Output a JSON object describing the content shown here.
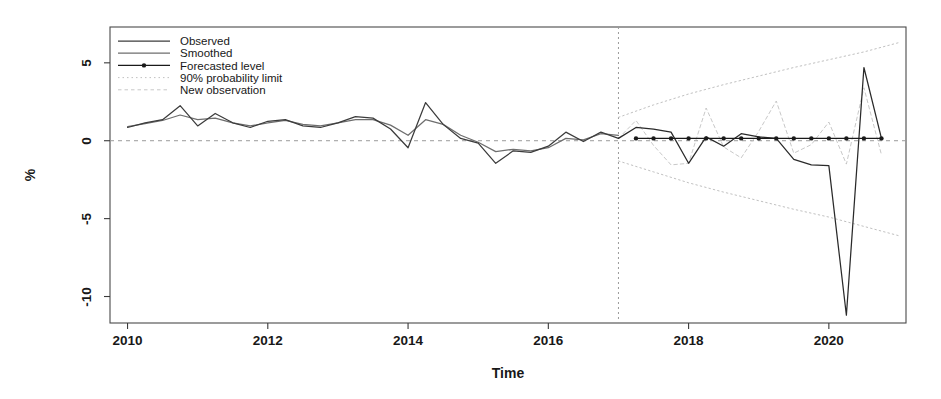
{
  "chart_data": {
    "type": "line",
    "title": "",
    "xlabel": "Time",
    "ylabel": "%",
    "xlim": [
      2009.75,
      2021.1
    ],
    "ylim": [
      -11.7,
      7.3
    ],
    "yticks": [
      5,
      0,
      -5,
      -10
    ],
    "ytick_labels": [
      "5",
      "0",
      "-5",
      "-10"
    ],
    "xticks": [
      2010,
      2012,
      2014,
      2016,
      2018,
      2020
    ],
    "xtick_labels": [
      "2010",
      "2012",
      "2014",
      "2016",
      "2018",
      "2020"
    ],
    "grid": false,
    "zero_reference_line": 0,
    "forecast_origin": 2017.0,
    "legend_position": "top-left",
    "legend": [
      {
        "label": "Observed",
        "style": "solid",
        "color": "#3c3c3c"
      },
      {
        "label": "Smoothed",
        "style": "solid",
        "color": "#6e6e6e"
      },
      {
        "label": "Forecasted level",
        "style": "solid-point",
        "color": "#1a1a1a"
      },
      {
        "label": "90% probability limit",
        "style": "dotted",
        "color": "#b9b9b9"
      },
      {
        "label": "New observation",
        "style": "dashed",
        "color": "#c2c2c2"
      }
    ],
    "series": [
      {
        "name": "Observed",
        "style": "solid",
        "color": "#3c3c3c",
        "x": [
          2010.0,
          2010.25,
          2010.5,
          2010.75,
          2011.0,
          2011.25,
          2011.5,
          2011.75,
          2012.0,
          2012.25,
          2012.5,
          2012.75,
          2013.0,
          2013.25,
          2013.5,
          2013.75,
          2014.0,
          2014.25,
          2014.5,
          2014.75,
          2015.0,
          2015.25,
          2015.5,
          2015.75,
          2016.0,
          2016.25,
          2016.5,
          2016.75,
          2017.0
        ],
        "y": [
          0.85,
          1.15,
          1.35,
          2.25,
          0.95,
          1.75,
          1.15,
          0.85,
          1.25,
          1.35,
          0.95,
          0.85,
          1.15,
          1.55,
          1.45,
          0.75,
          -0.45,
          2.45,
          1.05,
          0.15,
          -0.15,
          -1.45,
          -0.65,
          -0.75,
          -0.35,
          0.55,
          -0.05,
          0.55,
          0.15
        ]
      },
      {
        "name": "Smoothed",
        "style": "solid",
        "color": "#6e6e6e",
        "x": [
          2010.0,
          2010.25,
          2010.5,
          2010.75,
          2011.0,
          2011.25,
          2011.5,
          2011.75,
          2012.0,
          2012.25,
          2012.5,
          2012.75,
          2013.0,
          2013.25,
          2013.5,
          2013.75,
          2014.0,
          2014.25,
          2014.5,
          2014.75,
          2015.0,
          2015.25,
          2015.5,
          2015.75,
          2016.0,
          2016.25,
          2016.5,
          2016.75,
          2017.0
        ],
        "y": [
          0.9,
          1.1,
          1.3,
          1.65,
          1.35,
          1.45,
          1.15,
          0.95,
          1.15,
          1.3,
          1.05,
          0.95,
          1.15,
          1.35,
          1.35,
          1.0,
          0.35,
          1.35,
          1.05,
          0.35,
          -0.1,
          -0.7,
          -0.55,
          -0.65,
          -0.45,
          0.15,
          0.05,
          0.45,
          0.35
        ]
      },
      {
        "name": "Forecasted level",
        "style": "solid-point",
        "color": "#1a1a1a",
        "x": [
          2017.25,
          2017.5,
          2017.75,
          2018.0,
          2018.25,
          2018.5,
          2018.75,
          2019.0,
          2019.25,
          2019.5,
          2019.75,
          2020.0,
          2020.25,
          2020.5,
          2020.75
        ],
        "y": [
          0.15,
          0.15,
          0.15,
          0.15,
          0.15,
          0.15,
          0.15,
          0.15,
          0.15,
          0.15,
          0.15,
          0.15,
          0.15,
          0.15,
          0.15
        ]
      },
      {
        "name": "90% probability limit upper",
        "style": "dotted",
        "color": "#b9b9b9",
        "x": [
          2017.0,
          2017.5,
          2018.0,
          2018.5,
          2019.0,
          2019.5,
          2020.0,
          2020.5,
          2021.0
        ],
        "y": [
          1.5,
          2.3,
          3.0,
          3.6,
          4.15,
          4.7,
          5.2,
          5.7,
          6.3
        ]
      },
      {
        "name": "90% probability limit lower",
        "style": "dotted",
        "color": "#b9b9b9",
        "x": [
          2017.0,
          2017.5,
          2018.0,
          2018.5,
          2019.0,
          2019.5,
          2020.0,
          2020.5,
          2021.0
        ],
        "y": [
          -1.3,
          -2.0,
          -2.7,
          -3.3,
          -3.85,
          -4.4,
          -4.9,
          -5.5,
          -6.1
        ]
      },
      {
        "name": "New observation",
        "style": "dashed",
        "color": "#c2c2c2",
        "x": [
          2017.0,
          2017.25,
          2017.5,
          2017.75,
          2018.0,
          2018.25,
          2018.5,
          2018.75,
          2019.0,
          2019.25,
          2019.5,
          2019.75,
          2020.0,
          2020.25,
          2020.5,
          2020.75
        ],
        "y": [
          0.15,
          1.3,
          -0.3,
          -1.55,
          -1.45,
          2.1,
          -0.4,
          -1.1,
          0.6,
          2.55,
          -0.8,
          -0.25,
          1.2,
          -1.5,
          3.4,
          -0.9
        ]
      },
      {
        "name": "New observation actual",
        "style": "solid",
        "color": "#2a2a2a",
        "x": [
          2017.0,
          2017.25,
          2017.5,
          2017.75,
          2018.0,
          2018.25,
          2018.5,
          2018.75,
          2019.0,
          2019.25,
          2019.5,
          2019.75,
          2020.0,
          2020.25,
          2020.5,
          2020.75
        ],
        "y": [
          0.15,
          0.85,
          0.75,
          0.55,
          -1.45,
          0.25,
          -0.35,
          0.45,
          0.25,
          0.15,
          -1.2,
          -1.55,
          -1.6,
          -11.2,
          4.7,
          0.15
        ]
      }
    ]
  }
}
